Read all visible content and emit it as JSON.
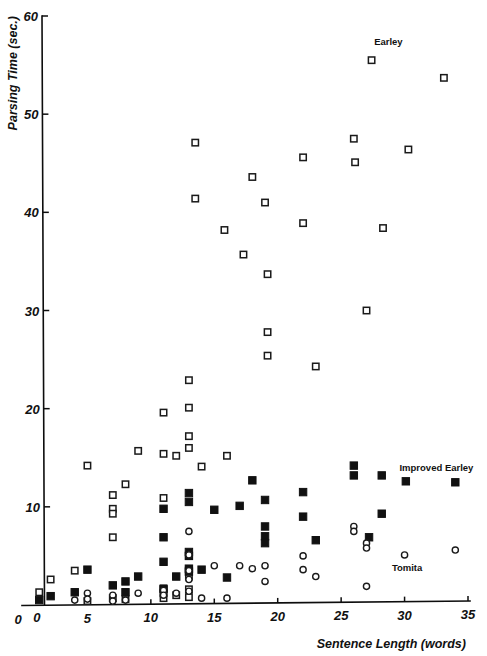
{
  "figure": {
    "background": "#ffffff",
    "ink_color": "#111111"
  },
  "chart_data": {
    "type": "scatter",
    "title": "",
    "xlabel": "Sentence Length (words)",
    "ylabel": "Parsing Time (sec.)",
    "xlim": [
      0,
      35
    ],
    "ylim": [
      0,
      60
    ],
    "xticks": [
      0,
      5,
      10,
      15,
      20,
      25,
      30,
      35
    ],
    "yticks": [
      0,
      10,
      20,
      30,
      40,
      50,
      60
    ],
    "xtick_labels": [
      "0",
      "5",
      "10",
      "15",
      "20",
      "25",
      "30",
      "35"
    ],
    "ytick_labels": [
      "0",
      "10",
      "20",
      "30",
      "40",
      "50",
      "60"
    ],
    "grid": false,
    "legend_position": "in-plot-annotations",
    "series": [
      {
        "name": "Earley",
        "marker": "open-square",
        "marker_color": "#ffffff",
        "edge_color": "#1a1a1a",
        "label_x": 27.6,
        "label_y": 57.0,
        "points": [
          [
            1.2,
            1.3
          ],
          [
            2.1,
            2.6
          ],
          [
            4.0,
            3.5
          ],
          [
            5.0,
            14.2
          ],
          [
            5.0,
            0.4
          ],
          [
            7.0,
            11.2
          ],
          [
            7.0,
            9.8
          ],
          [
            7.0,
            9.3
          ],
          [
            7.0,
            6.9
          ],
          [
            7.0,
            0.7
          ],
          [
            8.0,
            12.3
          ],
          [
            8.0,
            0.6
          ],
          [
            9.0,
            15.7
          ],
          [
            11.0,
            19.6
          ],
          [
            11.0,
            15.4
          ],
          [
            11.0,
            10.9
          ],
          [
            11.0,
            1.7
          ],
          [
            11.0,
            1.2
          ],
          [
            11.0,
            0.7
          ],
          [
            12.0,
            15.2
          ],
          [
            12.0,
            1.0
          ],
          [
            13.0,
            22.9
          ],
          [
            13.0,
            20.1
          ],
          [
            13.0,
            17.2
          ],
          [
            13.0,
            16.0
          ],
          [
            13.0,
            5.0
          ],
          [
            13.0,
            3.6
          ],
          [
            13.0,
            2.9
          ],
          [
            13.0,
            1.6
          ],
          [
            13.0,
            0.8
          ],
          [
            13.5,
            47.1
          ],
          [
            13.5,
            41.4
          ],
          [
            14.0,
            14.1
          ],
          [
            15.8,
            38.2
          ],
          [
            16.0,
            15.2
          ],
          [
            17.3,
            35.7
          ],
          [
            18.0,
            43.6
          ],
          [
            19.0,
            41.0
          ],
          [
            19.2,
            33.7
          ],
          [
            19.2,
            27.8
          ],
          [
            19.2,
            25.4
          ],
          [
            22.0,
            45.6
          ],
          [
            22.0,
            38.9
          ],
          [
            23.0,
            24.3
          ],
          [
            26.0,
            47.5
          ],
          [
            26.1,
            45.1
          ],
          [
            27.0,
            30.0
          ],
          [
            27.4,
            55.5
          ],
          [
            28.3,
            38.4
          ],
          [
            30.3,
            46.4
          ],
          [
            33.1,
            53.7
          ]
        ]
      },
      {
        "name": "Improved Earley",
        "marker": "filled-square",
        "marker_color": "#111111",
        "label_x": 29.6,
        "label_y": 13.6,
        "points": [
          [
            1.2,
            0.5
          ],
          [
            2.1,
            0.9
          ],
          [
            4.0,
            1.3
          ],
          [
            5.0,
            3.6
          ],
          [
            7.0,
            2.0
          ],
          [
            8.0,
            2.4
          ],
          [
            8.0,
            1.3
          ],
          [
            9.0,
            2.9
          ],
          [
            11.0,
            9.8
          ],
          [
            11.0,
            6.9
          ],
          [
            11.0,
            4.4
          ],
          [
            11.0,
            1.6
          ],
          [
            12.0,
            2.9
          ],
          [
            13.0,
            11.4
          ],
          [
            13.0,
            10.5
          ],
          [
            13.0,
            5.4
          ],
          [
            13.0,
            5.0
          ],
          [
            13.0,
            3.7
          ],
          [
            13.0,
            3.4
          ],
          [
            14.0,
            3.6
          ],
          [
            15.0,
            9.7
          ],
          [
            16.0,
            2.8
          ],
          [
            17.0,
            10.1
          ],
          [
            18.0,
            12.7
          ],
          [
            19.0,
            10.7
          ],
          [
            19.0,
            8.0
          ],
          [
            19.0,
            7.0
          ],
          [
            19.0,
            6.3
          ],
          [
            22.0,
            11.5
          ],
          [
            22.0,
            9.0
          ],
          [
            23.0,
            6.6
          ],
          [
            26.0,
            14.2
          ],
          [
            26.0,
            13.2
          ],
          [
            27.2,
            6.9
          ],
          [
            28.2,
            13.2
          ],
          [
            28.2,
            9.3
          ],
          [
            30.1,
            12.6
          ],
          [
            34.0,
            12.5
          ]
        ]
      },
      {
        "name": "Tomita",
        "marker": "open-circle",
        "marker_color": "#ffffff",
        "edge_color": "#1a1a1a",
        "label_x": 29.0,
        "label_y": 3.5,
        "points": [
          [
            4.0,
            0.5
          ],
          [
            5.0,
            1.2
          ],
          [
            5.0,
            0.6
          ],
          [
            7.0,
            1.0
          ],
          [
            7.0,
            0.4
          ],
          [
            8.0,
            0.5
          ],
          [
            9.0,
            1.2
          ],
          [
            11.0,
            1.5
          ],
          [
            11.0,
            1.0
          ],
          [
            12.0,
            1.2
          ],
          [
            13.0,
            7.5
          ],
          [
            13.0,
            5.1
          ],
          [
            13.0,
            3.5
          ],
          [
            13.0,
            2.6
          ],
          [
            13.0,
            1.4
          ],
          [
            14.0,
            0.7
          ],
          [
            15.0,
            4.0
          ],
          [
            16.0,
            0.7
          ],
          [
            17.0,
            4.0
          ],
          [
            18.0,
            3.7
          ],
          [
            19.0,
            4.0
          ],
          [
            19.0,
            2.4
          ],
          [
            22.0,
            5.0
          ],
          [
            22.0,
            3.6
          ],
          [
            23.0,
            2.9
          ],
          [
            26.0,
            8.0
          ],
          [
            26.0,
            7.5
          ],
          [
            27.0,
            6.3
          ],
          [
            27.0,
            5.8
          ],
          [
            27.0,
            1.9
          ],
          [
            30.0,
            5.1
          ],
          [
            34.0,
            5.6
          ]
        ]
      }
    ]
  }
}
